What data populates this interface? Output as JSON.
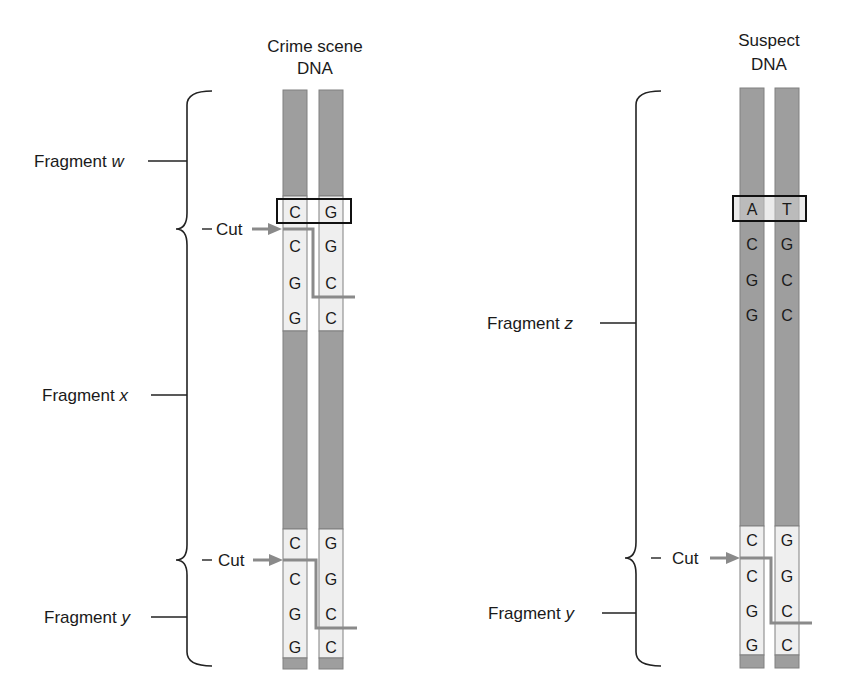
{
  "diagram": {
    "crime": {
      "title_line1": "Crime scene",
      "title_line2": "DNA",
      "highlight_pair": [
        "C",
        "G"
      ],
      "upper_left": [
        "C",
        "G",
        "G"
      ],
      "upper_right": [
        "G",
        "C",
        "C"
      ],
      "lower_left": [
        "C",
        "C",
        "G",
        "G"
      ],
      "lower_right": [
        "G",
        "G",
        "C",
        "C"
      ],
      "labels": {
        "w": {
          "prefix": "Fragment ",
          "var": "w"
        },
        "x": {
          "prefix": "Fragment ",
          "var": "x"
        },
        "y": {
          "prefix": "Fragment ",
          "var": "y"
        },
        "cut1": "Cut",
        "cut2": "Cut"
      }
    },
    "suspect": {
      "title_line1": "Suspect",
      "title_line2": "DNA",
      "highlight_pair": [
        "A",
        "T"
      ],
      "upper_left": [
        "C",
        "G",
        "G"
      ],
      "upper_right": [
        "G",
        "C",
        "C"
      ],
      "lower_left": [
        "C",
        "C",
        "G",
        "G"
      ],
      "lower_right": [
        "G",
        "G",
        "C",
        "C"
      ],
      "labels": {
        "z": {
          "prefix": "Fragment ",
          "var": "z"
        },
        "y": {
          "prefix": "Fragment ",
          "var": "y"
        },
        "cut": "Cut"
      }
    },
    "colors": {
      "strand_dark": "#9e9e9e",
      "strand_light": "#efefef",
      "cut_line": "#8a8a8a",
      "outline": "#111111"
    }
  }
}
